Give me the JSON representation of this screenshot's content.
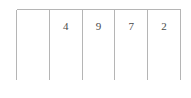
{
  "table": {
    "column_count": 5,
    "row_count": 1,
    "border_color": "#b5b5b5",
    "text_color": "#4a4a4a",
    "background_color": "#ffffff",
    "rows": [
      {
        "cells": [
          {
            "value": ""
          },
          {
            "value": "4"
          },
          {
            "value": "9"
          },
          {
            "value": "7"
          },
          {
            "value": "2"
          }
        ]
      }
    ]
  }
}
